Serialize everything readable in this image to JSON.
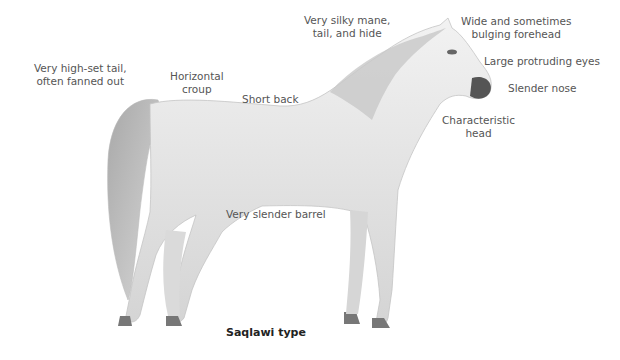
{
  "diagram": {
    "caption": "Saqlawi type",
    "labels": [
      {
        "id": "tail",
        "text_lines": [
          "Very high-set tail,",
          "often fanned out"
        ]
      },
      {
        "id": "croup",
        "text_lines": [
          "Horizontal",
          "croup"
        ]
      },
      {
        "id": "back",
        "text_lines": [
          "Short back"
        ]
      },
      {
        "id": "mane",
        "text_lines": [
          "Very silky mane,",
          "tail, and hide"
        ]
      },
      {
        "id": "forehead",
        "text_lines": [
          "Wide and sometimes",
          "bulging forehead"
        ]
      },
      {
        "id": "eyes",
        "text_lines": [
          "Large protruding eyes"
        ]
      },
      {
        "id": "nose",
        "text_lines": [
          "Slender nose"
        ]
      },
      {
        "id": "head",
        "text_lines": [
          "Characteristic",
          "head"
        ]
      },
      {
        "id": "barrel",
        "text_lines": [
          "Very slender barrel"
        ]
      }
    ],
    "colors": {
      "background": "#ffffff",
      "horse_light": "#eeeeee",
      "horse_shade": "#b8b8b8",
      "horse_dark": "#666666",
      "label_text": "#555555",
      "caption_text": "#222222"
    }
  }
}
